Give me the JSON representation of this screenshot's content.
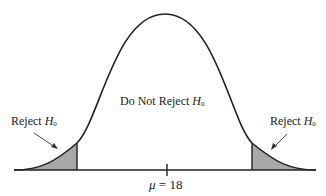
{
  "diagram": {
    "type": "normal-distribution-two-tailed-test",
    "mean_label": "μ = 18",
    "mean_symbol": "μ",
    "mean_value": "18",
    "regions": [
      {
        "name": "left-rejection",
        "label_prefix": "Reject ",
        "label_h": "H",
        "label_sub": "0"
      },
      {
        "name": "acceptance",
        "label_prefix": "Do Not Reject ",
        "label_h": "H",
        "label_sub": "0"
      },
      {
        "name": "right-rejection",
        "label_prefix": "Reject ",
        "label_h": "H",
        "label_sub": "0"
      }
    ],
    "colors": {
      "curve": "#222222",
      "shade": "#a8a8a8",
      "background": "#ffffff"
    }
  }
}
